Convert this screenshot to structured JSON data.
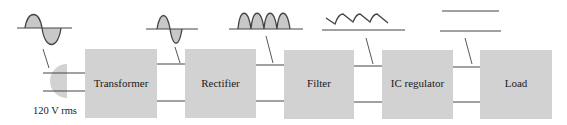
{
  "diagram": {
    "colors": {
      "block_fill": "#d2d2d2",
      "line": "#444444",
      "wave_fill": "#c8c8c8"
    },
    "blocks": [
      {
        "id": "transformer",
        "label": "Transformer"
      },
      {
        "id": "rectifier",
        "label": "Rectifier"
      },
      {
        "id": "filter",
        "label": "Filter"
      },
      {
        "id": "ic-regulator",
        "label": "IC regulator"
      },
      {
        "id": "load",
        "label": "Load"
      }
    ],
    "source": {
      "label": "120 V rms",
      "icon": "ac-plug-icon"
    },
    "waveforms": [
      {
        "id": "ac-input",
        "type": "sine",
        "description": "AC line voltage"
      },
      {
        "id": "transformer-output",
        "type": "sine",
        "description": "stepped-down AC"
      },
      {
        "id": "rectifier-output",
        "type": "full-wave-rectified",
        "description": "pulsating DC"
      },
      {
        "id": "filter-output",
        "type": "ripple",
        "description": "DC with ripple"
      },
      {
        "id": "regulator-output",
        "type": "dc",
        "description": "regulated DC"
      }
    ]
  }
}
